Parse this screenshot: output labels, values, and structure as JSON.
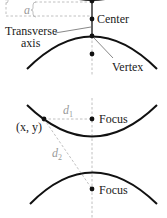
{
  "diagram_top": {
    "labels": {
      "a": "a",
      "center": "Center",
      "transverse_axis_line1": "Transverse",
      "transverse_axis_line2": "axis",
      "vertex": "Vertex"
    }
  },
  "diagram_bottom": {
    "labels": {
      "point": "(x, y)",
      "d1": "d",
      "d1_sub": "1",
      "d2": "d",
      "d2_sub": "2",
      "focus_top": "Focus",
      "focus_bottom": "Focus"
    }
  },
  "colors": {
    "curve": "#111111",
    "dashed": "#b0b0b0",
    "label_italic": "#9a9a9a",
    "text": "#1a1a1a"
  }
}
